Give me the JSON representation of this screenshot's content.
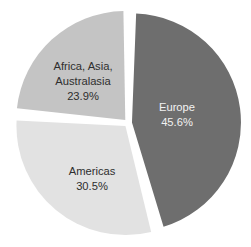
{
  "chart_data": {
    "type": "pie",
    "title": "",
    "clipped_title_fragment": "",
    "categories": [
      "Europe",
      "Americas",
      "Africa, Asia, Australasia"
    ],
    "values": [
      45.6,
      30.5,
      23.9
    ],
    "value_unit": "%",
    "legend": "none",
    "exploded": true,
    "gap_color": "#ffffff",
    "background": "#ffffff",
    "series": [
      {
        "name": "Share of total",
        "values": [
          45.6,
          30.5,
          23.9
        ]
      }
    ],
    "slices": [
      {
        "label": "Europe",
        "label_lines": [
          "Europe"
        ],
        "value": 45.6,
        "value_text": "45.6%",
        "color": "#6e6e6e",
        "text_color": "#f2f2f2",
        "start_angle_deg": 2.0,
        "end_angle_deg": 166.2,
        "label_x": 177,
        "label_y": 108
      },
      {
        "label": "Americas",
        "label_lines": [
          "Americas"
        ],
        "value": 30.5,
        "value_text": "30.5%",
        "color": "#e2e2e2",
        "text_color": "#2e2e2e",
        "start_angle_deg": 166.2,
        "end_angle_deg": 276.0,
        "label_x": 92,
        "label_y": 172
      },
      {
        "label": "Africa, Asia, Australasia",
        "label_lines": [
          "Africa, Asia,",
          "Australasia"
        ],
        "value": 23.9,
        "value_text": "23.9%",
        "color": "#c4c4c4",
        "text_color": "#2e2e2e",
        "start_angle_deg": 276.0,
        "end_angle_deg": 362.0,
        "label_x": 83,
        "label_y": 68
      }
    ]
  },
  "labels": {
    "europe_name": "Europe",
    "europe_value": "45.6%",
    "americas_name": "Americas",
    "americas_value": "30.5%",
    "africa_line1": "Africa, Asia,",
    "africa_line2": "Australasia",
    "africa_value": "23.9%"
  }
}
